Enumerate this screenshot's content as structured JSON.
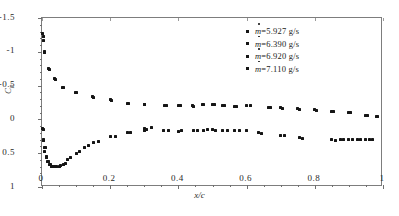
{
  "chart_data": {
    "type": "scatter",
    "title": "",
    "xlabel": "x/c",
    "ylabel": "Cp",
    "ylabel_base": "C",
    "ylabel_sub": "p",
    "xlim": [
      0,
      1
    ],
    "ylim": [
      1,
      -1.5
    ],
    "y_axis_inverted": true,
    "grid": false,
    "legend_position": "top-right",
    "xticks": [
      "0",
      "0.2",
      "0.4",
      "0.6",
      "0.8",
      "1"
    ],
    "xtick_values": [
      0,
      0.2,
      0.4,
      0.6,
      0.8,
      1
    ],
    "yticks": [
      "-1.5",
      "-1",
      "-0.5",
      "0",
      "0.5",
      "1"
    ],
    "ytick_values": [
      -1.5,
      -1,
      -0.5,
      0,
      0.5,
      1
    ],
    "marker": "square",
    "marker_color": "#151515",
    "series": [
      {
        "name": "ṁ=5.927 g/s",
        "label_prefix": "m",
        "label_suffix": "=5.927 g/s",
        "points": [
          [
            0.002,
            -1.27
          ],
          [
            0.004,
            -1.16
          ],
          [
            0.008,
            -1.0
          ],
          [
            0.02,
            -0.755
          ],
          [
            0.038,
            -0.6
          ],
          [
            0.06,
            -0.475
          ],
          [
            0.098,
            -0.4
          ],
          [
            0.148,
            -0.335
          ],
          [
            0.2,
            -0.29
          ],
          [
            0.25,
            -0.24
          ],
          [
            0.3,
            -0.225
          ],
          [
            0.36,
            -0.21
          ],
          [
            0.4,
            -0.2
          ],
          [
            0.44,
            -0.2
          ],
          [
            0.47,
            -0.225
          ],
          [
            0.5,
            -0.215
          ],
          [
            0.53,
            -0.2
          ],
          [
            0.565,
            -0.195
          ],
          [
            0.6,
            -0.21
          ],
          [
            0.665,
            -0.175
          ],
          [
            0.7,
            -0.17
          ],
          [
            0.75,
            -0.155
          ],
          [
            0.8,
            -0.14
          ],
          [
            0.85,
            -0.12
          ],
          [
            0.9,
            -0.1
          ],
          [
            0.95,
            -0.06
          ],
          [
            0.98,
            -0.05
          ]
        ]
      },
      {
        "name": "ṁ=6.390 g/s",
        "label_prefix": "m",
        "label_suffix": "=6.390 g/s",
        "points": [
          [
            0.003,
            -1.22
          ],
          [
            0.006,
            -0.99
          ],
          [
            0.022,
            -0.74
          ],
          [
            0.04,
            -0.59
          ],
          [
            0.062,
            -0.47
          ],
          [
            0.1,
            -0.395
          ],
          [
            0.15,
            -0.33
          ],
          [
            0.205,
            -0.285
          ],
          [
            0.255,
            -0.235
          ],
          [
            0.3,
            -0.22
          ],
          [
            0.365,
            -0.2
          ],
          [
            0.405,
            -0.205
          ],
          [
            0.445,
            -0.195
          ],
          [
            0.475,
            -0.215
          ],
          [
            0.505,
            -0.22
          ],
          [
            0.535,
            -0.205
          ],
          [
            0.57,
            -0.19
          ],
          [
            0.61,
            -0.2
          ],
          [
            0.67,
            -0.17
          ],
          [
            0.705,
            -0.165
          ],
          [
            0.755,
            -0.15
          ],
          [
            0.805,
            -0.135
          ],
          [
            0.855,
            -0.115
          ],
          [
            0.905,
            -0.095
          ],
          [
            0.955,
            -0.055
          ],
          [
            0.985,
            -0.045
          ]
        ]
      },
      {
        "name": "ṁ=6.920 g/s",
        "label_prefix": "m",
        "label_suffix": "=6.920 g/s",
        "points": [
          [
            0.002,
            0.135
          ],
          [
            0.004,
            0.3
          ],
          [
            0.006,
            0.41
          ],
          [
            0.008,
            0.48
          ],
          [
            0.012,
            0.555
          ],
          [
            0.016,
            0.625
          ],
          [
            0.022,
            0.66
          ],
          [
            0.028,
            0.69
          ],
          [
            0.036,
            0.695
          ],
          [
            0.05,
            0.69
          ],
          [
            0.062,
            0.66
          ],
          [
            0.075,
            0.6
          ],
          [
            0.1,
            0.5
          ],
          [
            0.125,
            0.42
          ],
          [
            0.15,
            0.345
          ],
          [
            0.2,
            0.26
          ],
          [
            0.25,
            0.19
          ],
          [
            0.3,
            0.16
          ],
          [
            0.3,
            0.13
          ],
          [
            0.355,
            0.17
          ],
          [
            0.4,
            0.175
          ],
          [
            0.445,
            0.165
          ],
          [
            0.475,
            0.16
          ],
          [
            0.5,
            0.155
          ],
          [
            0.53,
            0.16
          ],
          [
            0.565,
            0.165
          ],
          [
            0.6,
            0.17
          ],
          [
            0.635,
            0.2
          ],
          [
            0.7,
            0.24
          ],
          [
            0.755,
            0.27
          ],
          [
            0.85,
            0.3
          ],
          [
            0.875,
            0.3
          ],
          [
            0.9,
            0.3
          ],
          [
            0.925,
            0.3
          ],
          [
            0.95,
            0.295
          ],
          [
            0.97,
            0.29
          ]
        ]
      },
      {
        "name": "ṁ=7.110 g/s",
        "label_prefix": "m",
        "label_suffix": "=7.110 g/s",
        "points": [
          [
            0.003,
            0.145
          ],
          [
            0.005,
            0.315
          ],
          [
            0.009,
            0.42
          ],
          [
            0.014,
            0.565
          ],
          [
            0.018,
            0.63
          ],
          [
            0.025,
            0.665
          ],
          [
            0.032,
            0.695
          ],
          [
            0.042,
            0.7
          ],
          [
            0.055,
            0.675
          ],
          [
            0.068,
            0.645
          ],
          [
            0.085,
            0.56
          ],
          [
            0.11,
            0.47
          ],
          [
            0.135,
            0.39
          ],
          [
            0.165,
            0.32
          ],
          [
            0.215,
            0.25
          ],
          [
            0.26,
            0.2
          ],
          [
            0.305,
            0.155
          ],
          [
            0.32,
            0.125
          ],
          [
            0.37,
            0.165
          ],
          [
            0.41,
            0.17
          ],
          [
            0.455,
            0.16
          ],
          [
            0.485,
            0.155
          ],
          [
            0.51,
            0.16
          ],
          [
            0.545,
            0.165
          ],
          [
            0.58,
            0.17
          ],
          [
            0.645,
            0.21
          ],
          [
            0.71,
            0.245
          ],
          [
            0.765,
            0.28
          ],
          [
            0.86,
            0.305
          ],
          [
            0.885,
            0.3
          ],
          [
            0.91,
            0.3
          ],
          [
            0.935,
            0.3
          ],
          [
            0.96,
            0.29
          ]
        ]
      }
    ]
  },
  "legend": {
    "entries": [
      {
        "label": "=5.927 g/s"
      },
      {
        "label": "=6.390 g/s"
      },
      {
        "label": "=6.920 g/s"
      },
      {
        "label": "=7.110 g/s"
      }
    ],
    "symbol": "m"
  },
  "axes": {
    "x_title": "x/c",
    "y_title_base": "C",
    "y_title_sub": "p"
  }
}
